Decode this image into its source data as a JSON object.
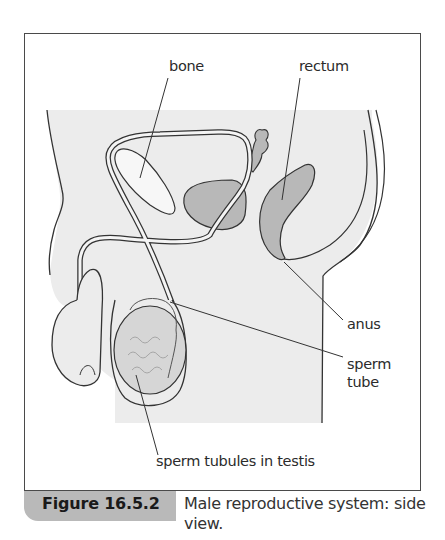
{
  "figure": {
    "number": "Figure 16.5.2",
    "caption": "Male reproductive system: side view.",
    "colors": {
      "body_fill": "#ececec",
      "organ_fill": "#b8b8b8",
      "outline": "#333333",
      "caption_tab": "#b9b9b9"
    }
  },
  "labels": {
    "bone": "bone",
    "rectum": "rectum",
    "anus": "anus",
    "sperm_tube_line1": "sperm",
    "sperm_tube_line2": "tube",
    "testis": "sperm tubules in testis"
  }
}
